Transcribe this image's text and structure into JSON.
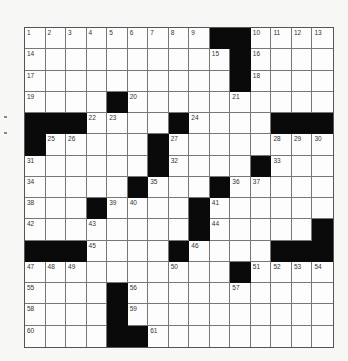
{
  "puzzle": {
    "rows": 15,
    "cols": 15,
    "colors": {
      "black_square": "#0a0a0a",
      "white_square": "#fdfdfd",
      "grid_line": "#777777",
      "number_text": "#333333",
      "background": "#f7f7f5"
    },
    "layout": [
      "123456789##ABCD",
      "E........F#G...",
      "H.........#I...",
      "J...#K....L....",
      "###MN..#O...###",
      "#PQ...#R....STU",
      "V.....#W...#X..",
      "Y....#Z..#ab...",
      "c..#de..#f.....",
      "g..h....#i....#",
      "###j...#k...###",
      "lmn....o..#pqrs",
      "t...#u....v....",
      "w...#x.........",
      "y...##z........"
    ],
    "grid": [
      [
        1,
        2,
        3,
        4,
        5,
        6,
        7,
        8,
        9,
        "#",
        "#",
        10,
        11,
        12,
        13
      ],
      [
        14,
        0,
        0,
        0,
        0,
        0,
        0,
        0,
        0,
        15,
        "#",
        16,
        0,
        0,
        0
      ],
      [
        17,
        0,
        0,
        0,
        0,
        0,
        0,
        0,
        0,
        0,
        "#",
        18,
        0,
        0,
        0
      ],
      [
        19,
        0,
        0,
        0,
        "#",
        20,
        0,
        0,
        0,
        0,
        21,
        0,
        0,
        0,
        0
      ],
      [
        "#",
        "#",
        "#",
        22,
        23,
        0,
        0,
        "#",
        24,
        0,
        0,
        0,
        "#",
        "#",
        "#"
      ],
      [
        "#",
        25,
        26,
        0,
        0,
        0,
        "#",
        27,
        0,
        0,
        0,
        0,
        28,
        29,
        30
      ],
      [
        31,
        0,
        0,
        0,
        0,
        0,
        "#",
        32,
        0,
        0,
        0,
        "#",
        33,
        0,
        0
      ],
      [
        34,
        0,
        0,
        0,
        0,
        "#",
        35,
        0,
        0,
        "#",
        36,
        37,
        0,
        0,
        0
      ],
      [
        38,
        0,
        0,
        "#",
        39,
        40,
        0,
        0,
        "#",
        41,
        0,
        0,
        0,
        0,
        0
      ],
      [
        42,
        0,
        0,
        43,
        0,
        0,
        0,
        0,
        "#",
        44,
        0,
        0,
        0,
        0,
        "#"
      ],
      [
        "#",
        "#",
        "#",
        45,
        0,
        0,
        0,
        "#",
        46,
        0,
        0,
        0,
        "#",
        "#",
        "#"
      ],
      [
        47,
        48,
        49,
        0,
        0,
        0,
        0,
        50,
        0,
        0,
        "#",
        51,
        52,
        53,
        54
      ],
      [
        55,
        0,
        0,
        0,
        "#",
        56,
        0,
        0,
        0,
        0,
        57,
        0,
        0,
        0,
        0
      ],
      [
        58,
        0,
        0,
        0,
        "#",
        59,
        0,
        0,
        0,
        0,
        0,
        0,
        0,
        0,
        0
      ],
      [
        60,
        0,
        0,
        0,
        "#",
        "#",
        61,
        0,
        0,
        0,
        0,
        0,
        0,
        0,
        0
      ]
    ],
    "clue_numbers": [
      1,
      2,
      3,
      4,
      5,
      6,
      7,
      8,
      9,
      10,
      11,
      12,
      13,
      14,
      15,
      16,
      17,
      18,
      19,
      20,
      21,
      22,
      23,
      24,
      25,
      26,
      27,
      28,
      29,
      30,
      31,
      32,
      33,
      34,
      35,
      36,
      37,
      38,
      39,
      40,
      41,
      42,
      43,
      44,
      45,
      46,
      47,
      48,
      49,
      50,
      51,
      52,
      53,
      54,
      55,
      56,
      57,
      58,
      59,
      60,
      61
    ],
    "entries": {}
  }
}
